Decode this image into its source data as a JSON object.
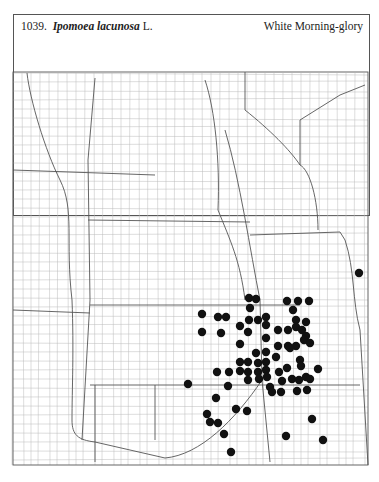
{
  "header": {
    "number": "1039.",
    "genus_species": "Ipomoea lacunosa",
    "author": "L.",
    "common_name": "White Morning-glory"
  },
  "chart_data": {
    "type": "map",
    "region": "Great Plains (ND, SD, NE, KS, OK, MN, IA, MO, WY, CO, MT) county outline map",
    "marker": "filled black circle",
    "occurrences": [
      [
        249,
        298
      ],
      [
        256,
        299
      ],
      [
        250,
        308
      ],
      [
        287,
        301
      ],
      [
        298,
        301
      ],
      [
        309,
        301
      ],
      [
        293,
        310
      ],
      [
        202,
        314
      ],
      [
        218,
        317
      ],
      [
        226,
        317
      ],
      [
        249,
        320
      ],
      [
        258,
        320
      ],
      [
        266,
        317
      ],
      [
        296,
        320
      ],
      [
        306,
        322
      ],
      [
        202,
        332
      ],
      [
        221,
        333
      ],
      [
        240,
        326
      ],
      [
        248,
        332
      ],
      [
        266,
        325
      ],
      [
        278,
        330
      ],
      [
        288,
        330
      ],
      [
        296,
        327
      ],
      [
        302,
        330
      ],
      [
        306,
        336
      ],
      [
        240,
        344
      ],
      [
        266,
        338
      ],
      [
        278,
        346
      ],
      [
        288,
        346
      ],
      [
        296,
        346
      ],
      [
        304,
        340
      ],
      [
        310,
        343
      ],
      [
        256,
        353
      ],
      [
        266,
        352
      ],
      [
        276,
        357
      ],
      [
        290,
        348
      ],
      [
        300,
        360
      ],
      [
        240,
        362
      ],
      [
        248,
        362
      ],
      [
        258,
        363
      ],
      [
        266,
        362
      ],
      [
        279,
        372
      ],
      [
        287,
        368
      ],
      [
        301,
        366
      ],
      [
        240,
        371
      ],
      [
        248,
        372
      ],
      [
        258,
        372
      ],
      [
        266,
        370
      ],
      [
        292,
        379
      ],
      [
        306,
        377
      ],
      [
        318,
        369
      ],
      [
        217,
        372
      ],
      [
        229,
        372
      ],
      [
        248,
        380
      ],
      [
        259,
        379
      ],
      [
        267,
        377
      ],
      [
        270,
        387
      ],
      [
        282,
        381
      ],
      [
        299,
        380
      ],
      [
        310,
        379
      ],
      [
        272,
        392
      ],
      [
        281,
        392
      ],
      [
        297,
        391
      ],
      [
        307,
        390
      ],
      [
        359,
        273
      ],
      [
        188,
        384
      ],
      [
        228,
        386
      ],
      [
        236,
        409
      ],
      [
        216,
        398
      ],
      [
        247,
        411
      ],
      [
        207,
        414
      ],
      [
        210,
        422
      ],
      [
        218,
        423
      ],
      [
        224,
        434
      ],
      [
        312,
        419
      ],
      [
        286,
        436
      ],
      [
        323,
        440
      ],
      [
        231,
        452
      ]
    ]
  }
}
